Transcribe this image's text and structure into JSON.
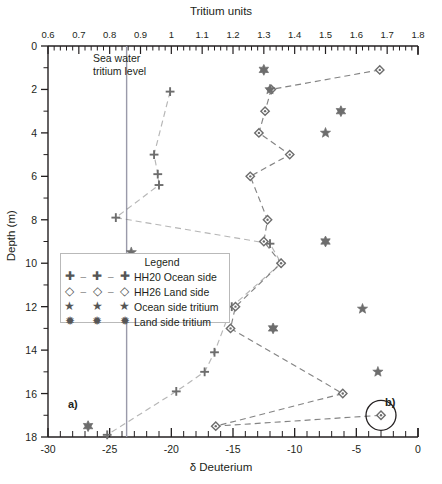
{
  "figure": {
    "title_top_axis": "Tritium units",
    "title_bottom_axis": "δ Deuterium",
    "title_left_axis": "Depth (m)",
    "annotations": {
      "sea_water_line_label_1": "Sea water",
      "sea_water_line_label_2": "tritium level",
      "panel_a": "a)",
      "panel_b": "b)"
    },
    "legend": {
      "title": "Legend",
      "entries": [
        {
          "marker": "plus-icon",
          "label": "HH20 Ocean side",
          "color": "#6d6d6d",
          "dashed": true
        },
        {
          "marker": "diamond-icon",
          "label": "HH26 Land side",
          "color": "#6d6d6d",
          "dashed": true
        },
        {
          "marker": "star-icon",
          "label": "Ocean side tritium",
          "color": "#6d6d6d",
          "dashed": false
        },
        {
          "marker": "star-bold-icon",
          "label": "Land side tritium",
          "color": "#6d6d6d",
          "dashed": false
        }
      ]
    }
  },
  "chart_data": {
    "type": "scatter",
    "title": "",
    "xlabel": "δ Deuterium",
    "ylabel": "Depth (m)",
    "x2label": "Tritium units",
    "xlim": [
      -30,
      0
    ],
    "x2lim": [
      0.6,
      1.8
    ],
    "ylim": [
      18,
      0
    ],
    "y_inverted": true,
    "grid": false,
    "legend_position": "center-left",
    "xticks": [
      -30,
      -25,
      -20,
      -15,
      -10,
      -5,
      0
    ],
    "x2ticks": [
      0.6,
      0.7,
      0.8,
      0.9,
      1.0,
      1.1,
      1.2,
      1.3,
      1.4,
      1.5,
      1.6,
      1.7,
      1.8
    ],
    "x2ticklabels": [
      "0.6",
      "0.7",
      "0.8",
      "0.9",
      "1",
      "1.1",
      "1.2",
      "1.3",
      "1.4",
      "1.5",
      "1.6",
      "1.7",
      "1.8"
    ],
    "yticks": [
      0,
      2,
      4,
      6,
      8,
      10,
      12,
      14,
      16,
      18
    ],
    "reference_lines": [
      {
        "name": "sea-water-tritium-level",
        "axis": "x2",
        "value": 0.855,
        "orientation": "vertical",
        "color": "#9a9aaa"
      }
    ],
    "series": [
      {
        "name": "HH20 Ocean side",
        "marker": "plus",
        "axis": "x-bottom",
        "line": "dashed",
        "color": "#6d6d6d",
        "points": [
          {
            "x": -20.1,
            "depth": 2.1
          },
          {
            "x": -21.4,
            "depth": 5.0
          },
          {
            "x": -21.1,
            "depth": 5.9
          },
          {
            "x": -21.0,
            "depth": 6.4
          },
          {
            "x": -24.5,
            "depth": 7.9
          },
          {
            "x": -12.0,
            "depth": 9.1
          },
          {
            "x": -11.1,
            "depth": 10.0
          },
          {
            "x": -15.1,
            "depth": 12.0
          },
          {
            "x": -16.5,
            "depth": 14.1
          },
          {
            "x": -17.3,
            "depth": 15.0
          },
          {
            "x": -19.6,
            "depth": 15.9
          },
          {
            "x": -25.2,
            "depth": 17.9
          }
        ]
      },
      {
        "name": "HH26 Land side",
        "marker": "diamond",
        "axis": "x-bottom",
        "line": "dashed",
        "color": "#6d6d6d",
        "points": [
          {
            "x": -3.1,
            "depth": 1.1
          },
          {
            "x": -11.9,
            "depth": 2.0
          },
          {
            "x": -12.4,
            "depth": 3.0
          },
          {
            "x": -12.9,
            "depth": 4.0
          },
          {
            "x": -10.4,
            "depth": 5.0
          },
          {
            "x": -13.6,
            "depth": 6.0
          },
          {
            "x": -12.2,
            "depth": 8.0
          },
          {
            "x": -12.5,
            "depth": 9.0
          },
          {
            "x": -11.1,
            "depth": 10.0
          },
          {
            "x": -14.8,
            "depth": 12.0
          },
          {
            "x": -15.2,
            "depth": 13.0
          },
          {
            "x": -6.1,
            "depth": 16.0
          },
          {
            "x": -16.4,
            "depth": 17.5
          },
          {
            "x": -3.0,
            "depth": 17.0
          }
        ]
      },
      {
        "name": "Ocean side tritium",
        "marker": "star",
        "axis": "x-top",
        "line": "none",
        "color": "#6d6d6d",
        "points": [
          {
            "x": 1.32,
            "depth": 2.0
          },
          {
            "x": 1.5,
            "depth": 4.0
          },
          {
            "x": 0.87,
            "depth": 9.5
          },
          {
            "x": 1.62,
            "depth": 12.1
          },
          {
            "x": 1.67,
            "depth": 15.0
          }
        ]
      },
      {
        "name": "Land side tritium",
        "marker": "star-bold",
        "axis": "x-top",
        "line": "none",
        "color": "#6d6d6d",
        "points": [
          {
            "x": 1.3,
            "depth": 1.1
          },
          {
            "x": 1.55,
            "depth": 3.0
          },
          {
            "x": 1.5,
            "depth": 9.0
          },
          {
            "x": 1.33,
            "depth": 13.0
          },
          {
            "x": 0.73,
            "depth": 17.5
          }
        ]
      }
    ],
    "callouts": [
      {
        "name": "circle-highlight-b",
        "x": -3.0,
        "depth": 17.0,
        "radius_px": 15
      }
    ]
  }
}
